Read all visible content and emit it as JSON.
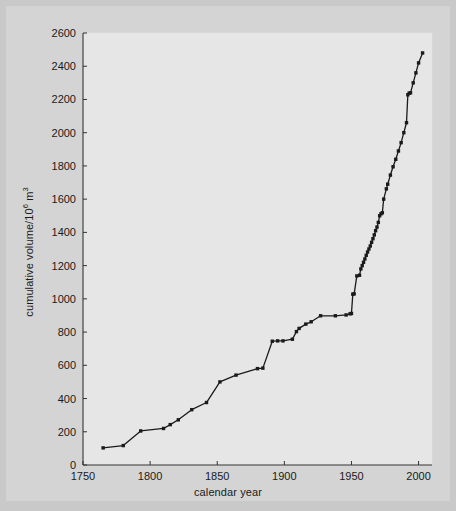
{
  "figure": {
    "background_color": "#c9c9c9",
    "panel_color": "#e6e6e6",
    "line_color": "#1a1a1a",
    "marker_color": "#1a1a1a",
    "axis_color": "#333333"
  },
  "chart_data": {
    "type": "line",
    "title": "",
    "xlabel": "calendar year",
    "ylabel_text": "cumulative volume/10",
    "ylabel_sup": "6",
    "ylabel_unit": " m",
    "ylabel_unit_sup": "3",
    "ylabel_full": "cumulative volume/10⁶ m³",
    "xlim": [
      1750,
      2010
    ],
    "ylim": [
      0,
      2600
    ],
    "xticks": [
      1750,
      1800,
      1850,
      1900,
      1950,
      2000
    ],
    "xtick_labels": [
      "1750",
      "1800",
      "1850",
      "1900",
      "1950",
      "2000"
    ],
    "yticks": [
      0,
      200,
      400,
      600,
      800,
      1000,
      1200,
      1400,
      1600,
      1800,
      2000,
      2200,
      2400,
      2600
    ],
    "ytick_labels": [
      "0",
      "200",
      "400",
      "600",
      "800",
      "1000",
      "1200",
      "1400",
      "1600",
      "1800",
      "2000",
      "2200",
      "2400",
      "2600"
    ],
    "grid": false,
    "legend": null,
    "marker": "square",
    "series": [
      {
        "name": "cumulative volume",
        "x": [
          1765,
          1780,
          1793,
          1810,
          1815,
          1821,
          1831,
          1842,
          1852,
          1864,
          1880,
          1884,
          1891,
          1895,
          1899,
          1906,
          1909,
          1911,
          1916,
          1920,
          1927,
          1938,
          1946,
          1949,
          1950,
          1951,
          1952,
          1954,
          1956,
          1957,
          1958,
          1959,
          1960,
          1961,
          1962,
          1963,
          1964,
          1965,
          1966,
          1967,
          1968,
          1969,
          1970,
          1971,
          1972,
          1973,
          1974,
          1976,
          1977,
          1979,
          1981,
          1983,
          1985,
          1987,
          1989,
          1991,
          1992,
          1993,
          1994,
          1996,
          1998,
          2000,
          2003
        ],
        "y": [
          103,
          117,
          205,
          220,
          243,
          272,
          333,
          376,
          500,
          541,
          580,
          583,
          745,
          747,
          747,
          757,
          803,
          822,
          848,
          862,
          898,
          898,
          903,
          910,
          912,
          1028,
          1030,
          1138,
          1142,
          1180,
          1200,
          1220,
          1240,
          1262,
          1282,
          1300,
          1318,
          1340,
          1362,
          1385,
          1410,
          1432,
          1460,
          1500,
          1512,
          1518,
          1600,
          1662,
          1690,
          1745,
          1795,
          1840,
          1890,
          1940,
          2000,
          2060,
          2228,
          2238,
          2240,
          2300,
          2360,
          2420,
          2480
        ]
      }
    ]
  }
}
